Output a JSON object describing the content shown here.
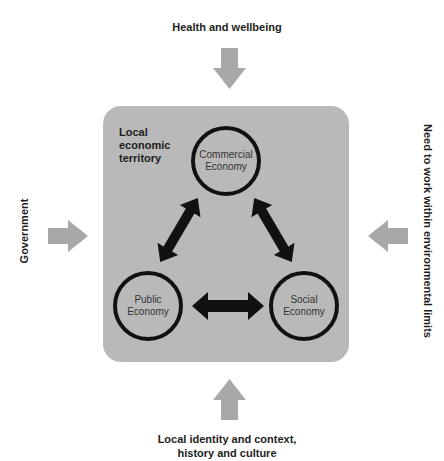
{
  "diagram": {
    "title_region": "Local economic territory",
    "inputs": {
      "top": "Health and wellbeing",
      "left": "Government",
      "right": "Need to work within environmental limits",
      "bottom_line1": "Local identity and context,",
      "bottom_line2": "history and culture"
    },
    "territory": {
      "label_line1": "Local",
      "label_line2": "economic",
      "label_line3": "territory"
    },
    "nodes": {
      "commercial": {
        "line1": "Commercial",
        "line2": "Economy"
      },
      "public": {
        "line1": "Public",
        "line2": "Economy"
      },
      "social": {
        "line1": "Social",
        "line2": "Economy"
      }
    },
    "colors": {
      "territory_fill": "#b9b9b9",
      "input_arrow": "#a8a8a8",
      "link_arrow": "#111111"
    },
    "links": [
      {
        "from": "Commercial Economy",
        "to": "Public Economy",
        "bidirectional": true
      },
      {
        "from": "Commercial Economy",
        "to": "Social Economy",
        "bidirectional": true
      },
      {
        "from": "Public Economy",
        "to": "Social Economy",
        "bidirectional": true
      }
    ]
  }
}
